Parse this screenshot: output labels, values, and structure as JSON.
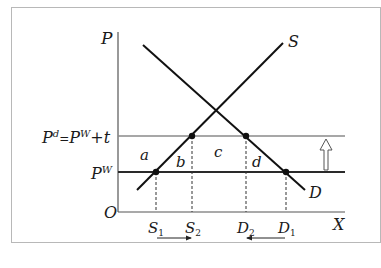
{
  "diagram": {
    "type": "tariff-supply-demand",
    "axes": {
      "y_label": "P",
      "x_label": "X",
      "origin_label": "O"
    },
    "curves": [
      {
        "name": "supply",
        "label": "S"
      },
      {
        "name": "demand",
        "label": "D"
      }
    ],
    "price_lines": {
      "domestic": {
        "label_main": "P",
        "label_sup": "d",
        "eq": "=",
        "rhs_main": "P",
        "rhs_sup": "W",
        "rhs_tail": "+t"
      },
      "world": {
        "label_main": "P",
        "label_sup": "W"
      }
    },
    "areas": [
      "a",
      "b",
      "c",
      "d"
    ],
    "quantities": [
      {
        "main": "S",
        "sub": "1"
      },
      {
        "main": "S",
        "sub": "2"
      },
      {
        "main": "D",
        "sub": "2"
      },
      {
        "main": "D",
        "sub": "1"
      }
    ],
    "arrows": {
      "supply_shift": "right",
      "demand_shift": "left",
      "price_rise": "up"
    }
  }
}
